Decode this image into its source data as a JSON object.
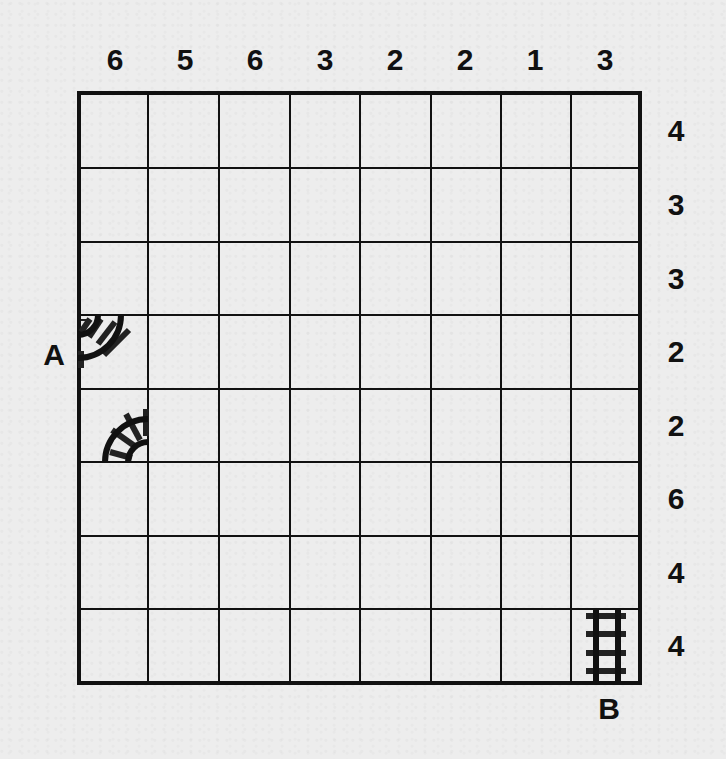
{
  "puzzle": {
    "type": "train-tracks",
    "grid": {
      "rows": 8,
      "cols": 8
    },
    "column_clues": [
      "6",
      "5",
      "6",
      "3",
      "2",
      "2",
      "1",
      "3"
    ],
    "row_clues": [
      "4",
      "3",
      "3",
      "2",
      "2",
      "6",
      "4",
      "4"
    ],
    "endpoints": {
      "A": {
        "label": "A",
        "row": 4,
        "col": 1,
        "side": "left"
      },
      "B": {
        "label": "B",
        "row": 8,
        "col": 8,
        "side": "bottom"
      }
    },
    "given_tracks": [
      {
        "row": 4,
        "col": 1,
        "piece": "curve-left-top"
      },
      {
        "row": 5,
        "col": 1,
        "piece": "curve-right-bottom"
      },
      {
        "row": 8,
        "col": 8,
        "piece": "straight-vertical"
      }
    ],
    "colors": {
      "ink": "#111111",
      "paper": "#ededed"
    }
  }
}
